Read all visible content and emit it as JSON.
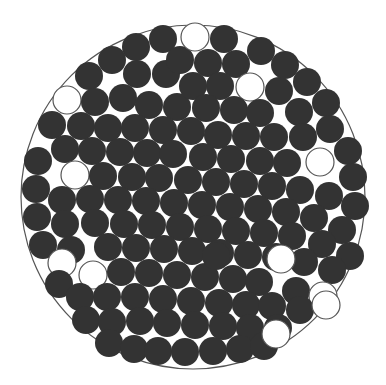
{
  "diagram": {
    "title": "",
    "container": {
      "cx": 193,
      "cy": 197,
      "r": 172,
      "stroke": "#555555"
    },
    "disk_radius": 14,
    "filled_color": "#333333",
    "empty_color": "#ffffff",
    "empty_stroke": "#555555",
    "circles": [
      {
        "x": 163,
        "y": 39,
        "f": 1
      },
      {
        "x": 136,
        "y": 47,
        "f": 1
      },
      {
        "x": 112,
        "y": 60,
        "f": 1
      },
      {
        "x": 89,
        "y": 76,
        "f": 1
      },
      {
        "x": 67,
        "y": 100,
        "f": 0
      },
      {
        "x": 95,
        "y": 102,
        "f": 1
      },
      {
        "x": 123,
        "y": 98,
        "f": 1
      },
      {
        "x": 137,
        "y": 74,
        "f": 1
      },
      {
        "x": 166,
        "y": 74,
        "f": 1
      },
      {
        "x": 180,
        "y": 60,
        "f": 1
      },
      {
        "x": 149,
        "y": 105,
        "f": 1
      },
      {
        "x": 177,
        "y": 107,
        "f": 1
      },
      {
        "x": 52,
        "y": 125,
        "f": 1
      },
      {
        "x": 81,
        "y": 126,
        "f": 1
      },
      {
        "x": 108,
        "y": 128,
        "f": 1
      },
      {
        "x": 135,
        "y": 128,
        "f": 1
      },
      {
        "x": 163,
        "y": 130,
        "f": 1
      },
      {
        "x": 65,
        "y": 149,
        "f": 1
      },
      {
        "x": 92,
        "y": 151,
        "f": 1
      },
      {
        "x": 120,
        "y": 152,
        "f": 1
      },
      {
        "x": 147,
        "y": 153,
        "f": 1
      },
      {
        "x": 173,
        "y": 154,
        "f": 1
      },
      {
        "x": 38,
        "y": 161,
        "f": 1
      },
      {
        "x": 75,
        "y": 175,
        "f": 0
      },
      {
        "x": 103,
        "y": 176,
        "f": 1
      },
      {
        "x": 132,
        "y": 177,
        "f": 1
      },
      {
        "x": 159,
        "y": 178,
        "f": 1
      },
      {
        "x": 195,
        "y": 37,
        "f": 0
      },
      {
        "x": 224,
        "y": 39,
        "f": 1
      },
      {
        "x": 261,
        "y": 51,
        "f": 1
      },
      {
        "x": 285,
        "y": 65,
        "f": 1
      },
      {
        "x": 307,
        "y": 82,
        "f": 1
      },
      {
        "x": 326,
        "y": 103,
        "f": 1
      },
      {
        "x": 208,
        "y": 63,
        "f": 1
      },
      {
        "x": 236,
        "y": 64,
        "f": 1
      },
      {
        "x": 250,
        "y": 87,
        "f": 0
      },
      {
        "x": 279,
        "y": 91,
        "f": 1
      },
      {
        "x": 299,
        "y": 112,
        "f": 1
      },
      {
        "x": 330,
        "y": 129,
        "f": 1
      },
      {
        "x": 348,
        "y": 151,
        "f": 1
      },
      {
        "x": 320,
        "y": 162,
        "f": 0
      },
      {
        "x": 353,
        "y": 177,
        "f": 1
      },
      {
        "x": 220,
        "y": 86,
        "f": 1
      },
      {
        "x": 193,
        "y": 86,
        "f": 1
      },
      {
        "x": 206,
        "y": 108,
        "f": 1
      },
      {
        "x": 234,
        "y": 110,
        "f": 1
      },
      {
        "x": 260,
        "y": 113,
        "f": 1
      },
      {
        "x": 218,
        "y": 135,
        "f": 1
      },
      {
        "x": 246,
        "y": 136,
        "f": 1
      },
      {
        "x": 274,
        "y": 137,
        "f": 1
      },
      {
        "x": 303,
        "y": 137,
        "f": 1
      },
      {
        "x": 231,
        "y": 159,
        "f": 1
      },
      {
        "x": 260,
        "y": 161,
        "f": 1
      },
      {
        "x": 287,
        "y": 163,
        "f": 1
      },
      {
        "x": 203,
        "y": 157,
        "f": 1
      },
      {
        "x": 191,
        "y": 131,
        "f": 1
      },
      {
        "x": 188,
        "y": 180,
        "f": 1
      },
      {
        "x": 216,
        "y": 182,
        "f": 1
      },
      {
        "x": 244,
        "y": 184,
        "f": 1
      },
      {
        "x": 272,
        "y": 186,
        "f": 1
      },
      {
        "x": 300,
        "y": 190,
        "f": 1
      },
      {
        "x": 329,
        "y": 196,
        "f": 1
      },
      {
        "x": 355,
        "y": 206,
        "f": 1
      },
      {
        "x": 36,
        "y": 189,
        "f": 1
      },
      {
        "x": 62,
        "y": 200,
        "f": 1
      },
      {
        "x": 90,
        "y": 199,
        "f": 1
      },
      {
        "x": 118,
        "y": 200,
        "f": 1
      },
      {
        "x": 146,
        "y": 201,
        "f": 1
      },
      {
        "x": 174,
        "y": 203,
        "f": 1
      },
      {
        "x": 202,
        "y": 205,
        "f": 1
      },
      {
        "x": 230,
        "y": 207,
        "f": 1
      },
      {
        "x": 258,
        "y": 209,
        "f": 1
      },
      {
        "x": 286,
        "y": 212,
        "f": 1
      },
      {
        "x": 314,
        "y": 218,
        "f": 1
      },
      {
        "x": 342,
        "y": 230,
        "f": 1
      },
      {
        "x": 37,
        "y": 217,
        "f": 1
      },
      {
        "x": 65,
        "y": 224,
        "f": 1
      },
      {
        "x": 95,
        "y": 223,
        "f": 1
      },
      {
        "x": 124,
        "y": 224,
        "f": 1
      },
      {
        "x": 152,
        "y": 225,
        "f": 1
      },
      {
        "x": 180,
        "y": 227,
        "f": 1
      },
      {
        "x": 208,
        "y": 229,
        "f": 1
      },
      {
        "x": 236,
        "y": 231,
        "f": 1
      },
      {
        "x": 264,
        "y": 233,
        "f": 1
      },
      {
        "x": 292,
        "y": 236,
        "f": 1
      },
      {
        "x": 322,
        "y": 244,
        "f": 1
      },
      {
        "x": 350,
        "y": 256,
        "f": 1
      },
      {
        "x": 43,
        "y": 245,
        "f": 1
      },
      {
        "x": 71,
        "y": 250,
        "f": 1
      },
      {
        "x": 108,
        "y": 247,
        "f": 1
      },
      {
        "x": 136,
        "y": 248,
        "f": 1
      },
      {
        "x": 164,
        "y": 249,
        "f": 1
      },
      {
        "x": 192,
        "y": 251,
        "f": 1
      },
      {
        "x": 220,
        "y": 253,
        "f": 1
      },
      {
        "x": 248,
        "y": 255,
        "f": 1
      },
      {
        "x": 276,
        "y": 257,
        "f": 1
      },
      {
        "x": 304,
        "y": 262,
        "f": 1
      },
      {
        "x": 332,
        "y": 270,
        "f": 1
      },
      {
        "x": 62,
        "y": 263,
        "f": 0
      },
      {
        "x": 93,
        "y": 275,
        "f": 0
      },
      {
        "x": 121,
        "y": 272,
        "f": 1
      },
      {
        "x": 149,
        "y": 273,
        "f": 1
      },
      {
        "x": 177,
        "y": 275,
        "f": 1
      },
      {
        "x": 205,
        "y": 277,
        "f": 1
      },
      {
        "x": 233,
        "y": 279,
        "f": 1
      },
      {
        "x": 259,
        "y": 282,
        "f": 1
      },
      {
        "x": 281,
        "y": 259,
        "f": 0
      },
      {
        "x": 296,
        "y": 291,
        "f": 1
      },
      {
        "x": 323,
        "y": 296,
        "f": 0
      },
      {
        "x": 59,
        "y": 284,
        "f": 1
      },
      {
        "x": 80,
        "y": 297,
        "f": 1
      },
      {
        "x": 107,
        "y": 297,
        "f": 1
      },
      {
        "x": 135,
        "y": 297,
        "f": 1
      },
      {
        "x": 163,
        "y": 299,
        "f": 1
      },
      {
        "x": 191,
        "y": 301,
        "f": 1
      },
      {
        "x": 219,
        "y": 303,
        "f": 1
      },
      {
        "x": 246,
        "y": 305,
        "f": 1
      },
      {
        "x": 272,
        "y": 306,
        "f": 1
      },
      {
        "x": 300,
        "y": 310,
        "f": 1
      },
      {
        "x": 86,
        "y": 320,
        "f": 1
      },
      {
        "x": 112,
        "y": 322,
        "f": 1
      },
      {
        "x": 140,
        "y": 321,
        "f": 1
      },
      {
        "x": 167,
        "y": 323,
        "f": 1
      },
      {
        "x": 195,
        "y": 325,
        "f": 1
      },
      {
        "x": 223,
        "y": 326,
        "f": 1
      },
      {
        "x": 250,
        "y": 328,
        "f": 1
      },
      {
        "x": 278,
        "y": 328,
        "f": 1
      },
      {
        "x": 109,
        "y": 343,
        "f": 1
      },
      {
        "x": 134,
        "y": 349,
        "f": 1
      },
      {
        "x": 158,
        "y": 351,
        "f": 1
      },
      {
        "x": 185,
        "y": 352,
        "f": 1
      },
      {
        "x": 213,
        "y": 351,
        "f": 1
      },
      {
        "x": 240,
        "y": 349,
        "f": 1
      },
      {
        "x": 264,
        "y": 346,
        "f": 1
      },
      {
        "x": 276,
        "y": 334,
        "f": 0
      },
      {
        "x": 326,
        "y": 305,
        "f": 0
      },
      {
        "x": 216,
        "y": 256,
        "f": 1
      }
    ]
  }
}
